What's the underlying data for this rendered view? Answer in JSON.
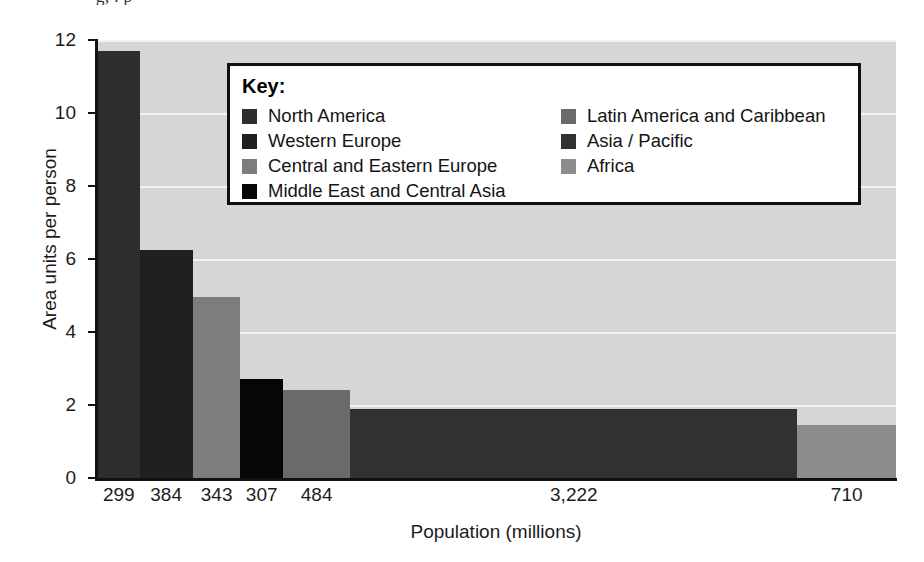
{
  "figure": {
    "clipped_title": "g,   .          p",
    "background": "#ffffff",
    "panel_background": "#d6d6d6",
    "gridline_color": "#f4f4f4",
    "axis_color": "#111111"
  },
  "legend": {
    "title": "Key:",
    "left_column": [
      {
        "label": "North America",
        "color": "#2e2e2e"
      },
      {
        "label": "Western Europe",
        "color": "#202020"
      },
      {
        "label": "Central and Eastern Europe",
        "color": "#7d7d7d"
      },
      {
        "label": "Middle East and Central Asia",
        "color": "#060606"
      }
    ],
    "right_column": [
      {
        "label": "Latin America and Caribbean",
        "color": "#6a6a6a"
      },
      {
        "label": "Asia / Pacific",
        "color": "#313131"
      },
      {
        "label": "Africa",
        "color": "#8c8c8c"
      }
    ]
  },
  "chart_data": {
    "type": "bar",
    "title": "",
    "xlabel": "Population (millions)",
    "ylabel": "Area units per person",
    "ylim": [
      0,
      12
    ],
    "yticks": [
      0,
      2,
      4,
      6,
      8,
      10,
      12
    ],
    "ytick_labels": [
      "0",
      "2",
      "4",
      "6",
      "8",
      "10",
      "12"
    ],
    "grid": true,
    "grid_axis": "y",
    "legend_position": "inside-top-center",
    "variable_width": true,
    "xlim_total_population": 5849,
    "categories": [
      "North America",
      "Western Europe",
      "Central and Eastern Europe",
      "Middle East and Central Asia",
      "Latin America and Caribbean",
      "Asia / Pacific",
      "Africa"
    ],
    "xtick_labels": [
      "299",
      "384",
      "343",
      "307",
      "484",
      "3,222",
      "710"
    ],
    "populations": [
      299,
      384,
      343,
      307,
      484,
      3222,
      710
    ],
    "values": [
      11.7,
      6.25,
      4.95,
      2.7,
      2.4,
      1.9,
      1.45
    ],
    "bars": [
      {
        "category": "North America",
        "population": 299,
        "population_label": "299",
        "value": 11.7,
        "color": "#2e2e2e"
      },
      {
        "category": "Western Europe",
        "population": 384,
        "population_label": "384",
        "value": 6.25,
        "color": "#202020"
      },
      {
        "category": "Central and Eastern Europe",
        "population": 343,
        "population_label": "343",
        "value": 4.95,
        "color": "#7d7d7d"
      },
      {
        "category": "Middle East and Central Asia",
        "population": 307,
        "population_label": "307",
        "value": 2.7,
        "color": "#060606"
      },
      {
        "category": "Latin America and Caribbean",
        "population": 484,
        "population_label": "484",
        "value": 2.4,
        "color": "#6a6a6a"
      },
      {
        "category": "Asia / Pacific",
        "population": 3222,
        "population_label": "3,222",
        "value": 1.9,
        "color": "#313131"
      },
      {
        "category": "Africa",
        "population": 710,
        "population_label": "710",
        "value": 1.45,
        "color": "#8c8c8c"
      }
    ]
  }
}
